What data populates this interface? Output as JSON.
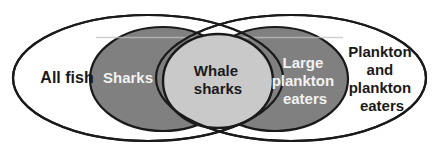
{
  "diagram": {
    "type": "venn",
    "background_color": "#ffffff",
    "outline_color": "#1a1a1a",
    "sets": [
      {
        "id": "all-fish",
        "label": "All fish",
        "label_lines": [
          "All fish"
        ],
        "fill_color": "#ffffff",
        "text_color": "#1a1a1a",
        "shape": "ellipse",
        "cx": 148,
        "cy": 78,
        "rx": 135,
        "ry": 63
      },
      {
        "id": "plankton-and-plankton-eaters",
        "label": "Plankton and plankton eaters",
        "label_lines": [
          "Plankton",
          "and",
          "plankton",
          "eaters"
        ],
        "fill_color": "#ffffff",
        "text_color": "#1a1a1a",
        "shape": "ellipse",
        "cx": 291,
        "cy": 78,
        "rx": 135,
        "ry": 63
      },
      {
        "id": "sharks",
        "label": "Sharks",
        "label_lines": [
          "Sharks"
        ],
        "fill_color": "#808080",
        "text_color": "#f2f2f2",
        "shape": "ellipse",
        "cx": 163,
        "cy": 79,
        "rx": 73,
        "ry": 52
      },
      {
        "id": "large-plankton-eaters",
        "label": "Large plankton eaters",
        "label_lines": [
          "Large",
          "plankton",
          "eaters"
        ],
        "fill_color": "#808080",
        "text_color": "#f2f2f2",
        "shape": "ellipse",
        "cx": 275,
        "cy": 79,
        "rx": 73,
        "ry": 52
      },
      {
        "id": "whale-sharks",
        "label": "Whale sharks",
        "label_lines": [
          "Whale",
          "sharks"
        ],
        "fill_color": "#c9c9c9",
        "text_color": "#1a1a1a",
        "shape": "circle",
        "cx": 218,
        "cy": 81,
        "rx": 55,
        "ry": 47
      }
    ],
    "labels": {
      "all_fish": "All fish",
      "sharks": "Sharks",
      "whale_sharks_line1": "Whale",
      "whale_sharks_line2": "sharks",
      "large_plankton_eaters_line1": "Large",
      "large_plankton_eaters_line2": "plankton",
      "large_plankton_eaters_line3": "eaters",
      "plankton_and_eaters_line1": "Plankton",
      "plankton_and_eaters_line2": "and",
      "plankton_and_eaters_line3": "plankton",
      "plankton_and_eaters_line4": "eaters"
    }
  }
}
